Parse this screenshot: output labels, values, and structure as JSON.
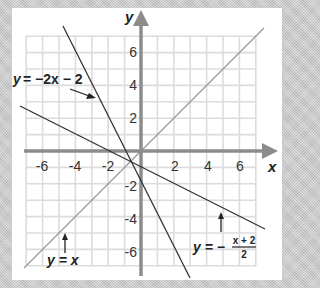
{
  "diagram": {
    "axes": {
      "x_label": "x",
      "y_label": "y",
      "x_ticks": [
        "-6",
        "-4",
        "-2",
        "2",
        "4",
        "6"
      ],
      "y_ticks": [
        "6",
        "4",
        "2",
        "-2",
        "-4",
        "-6"
      ],
      "range": [
        -7,
        7
      ]
    },
    "lines": [
      {
        "name": "line-y-eq-neg2x-minus-2",
        "label": "y = -2x - 2",
        "slope": -2,
        "intercept": -2
      },
      {
        "name": "line-y-eq-x",
        "label": "y = x",
        "slope": 1,
        "intercept": 0
      },
      {
        "name": "line-y-eq-neg-x-plus-2-over-2",
        "label": "y = -(x + 2)/2",
        "slope": -0.5,
        "intercept": -1
      }
    ],
    "labels": {
      "eq1_lhs": "y",
      "eq1_rhs": "= −2x − 2",
      "eq2": "y = x",
      "eq3_lhs": "y = −",
      "eq3_num": "x + 2",
      "eq3_den": "2"
    },
    "colors": {
      "axis": "#8c8c8c",
      "grid": "#dcdcdc",
      "line_dark": "#333333",
      "line_light": "#9a9a9a",
      "background": "#c9c9c9",
      "panel": "#ffffff"
    }
  }
}
